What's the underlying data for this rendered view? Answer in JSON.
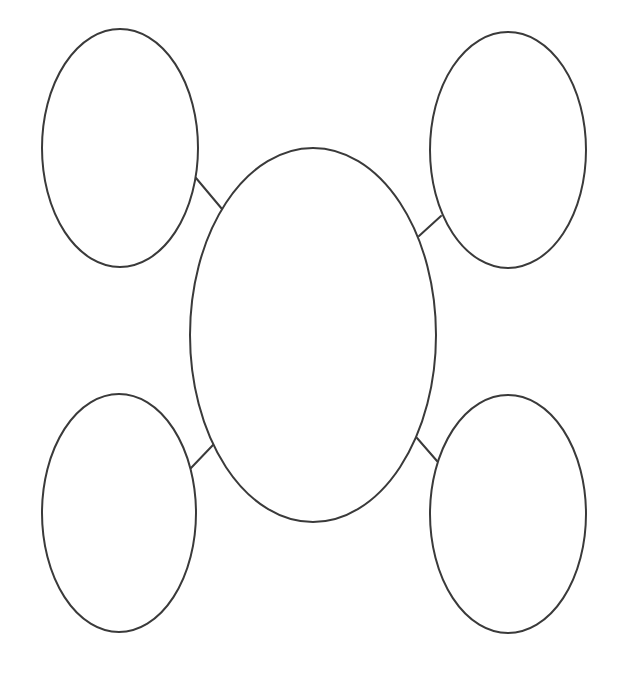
{
  "diagram": {
    "type": "bubble-map",
    "stroke_color": "#3a3a3a",
    "background_color": "#ffffff",
    "center": {
      "id": "center",
      "label": "",
      "cx": 313,
      "cy": 335,
      "rx": 123,
      "ry": 187
    },
    "satellites": [
      {
        "id": "top-left",
        "label": "",
        "cx": 120,
        "cy": 148,
        "rx": 78,
        "ry": 119
      },
      {
        "id": "top-right",
        "label": "",
        "cx": 508,
        "cy": 150,
        "rx": 78,
        "ry": 118
      },
      {
        "id": "bottom-left",
        "label": "",
        "cx": 119,
        "cy": 513,
        "rx": 77,
        "ry": 119
      },
      {
        "id": "bottom-right",
        "label": "",
        "cx": 508,
        "cy": 514,
        "rx": 78,
        "ry": 119
      }
    ],
    "connectors": [
      {
        "from": "top-left",
        "to": "center",
        "x1": 196,
        "y1": 178,
        "x2": 222,
        "y2": 209
      },
      {
        "from": "top-right",
        "to": "center",
        "x1": 441,
        "y1": 216,
        "x2": 419,
        "y2": 236
      },
      {
        "from": "bottom-left",
        "to": "center",
        "x1": 191,
        "y1": 468,
        "x2": 213,
        "y2": 445
      },
      {
        "from": "bottom-right",
        "to": "center",
        "x1": 437,
        "y1": 461,
        "x2": 417,
        "y2": 438
      }
    ]
  }
}
